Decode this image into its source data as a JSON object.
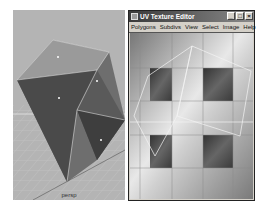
{
  "viewport": {
    "camera_label": "persp"
  },
  "uv_editor": {
    "title": "UV Texture Editor",
    "window_buttons": {
      "minimize": "_",
      "maximize": "□",
      "close": "×"
    },
    "menu": [
      "Polygons",
      "Subdivs",
      "View",
      "Select",
      "Image",
      "Help"
    ]
  }
}
